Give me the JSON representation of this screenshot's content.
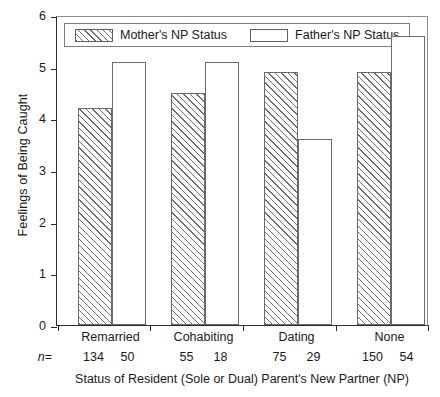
{
  "chart_data": {
    "type": "bar",
    "title": "",
    "xlabel": "Status of Resident (Sole or Dual) Parent's New Partner (NP)",
    "ylabel": "Feelings of Being Caught",
    "categories": [
      "Remarried",
      "Cohabiting",
      "Dating",
      "None"
    ],
    "series": [
      {
        "name": "Mother's NP Status",
        "values": [
          4.2,
          4.5,
          4.9,
          4.9
        ],
        "n": [
          134,
          55,
          75,
          150
        ],
        "fill": "hatched"
      },
      {
        "name": "Father's NP Status",
        "values": [
          5.1,
          5.1,
          3.6,
          5.6
        ],
        "n": [
          50,
          18,
          29,
          54
        ],
        "fill": "white"
      }
    ],
    "ylim": [
      0,
      6
    ],
    "yticks": [
      0,
      1,
      2,
      3,
      4,
      5,
      6
    ],
    "ytick_labels": [
      "0",
      "1",
      "2",
      "3",
      "4",
      "5",
      "6"
    ],
    "grid": false,
    "legend_position": "top-left-inside",
    "n_prefix": "n",
    "n_equals": "=",
    "colors": {
      "axis": "#2b2b2b",
      "frame": "#8d8d8d",
      "bar_outline": "#6a6a6a",
      "hatch": "#6f6f6f",
      "background": "#ffffff",
      "text": "#1a1a1a"
    }
  }
}
